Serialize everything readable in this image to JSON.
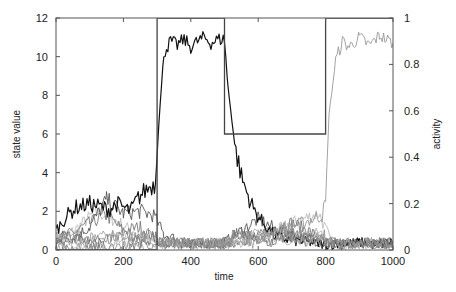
{
  "chart_data": {
    "type": "line",
    "title": "",
    "xlabel": "time",
    "ylabel": "state value",
    "y2label": "activity",
    "xlim": [
      0,
      1000
    ],
    "ylim": [
      0,
      12
    ],
    "y2lim": [
      0,
      1
    ],
    "x_ticks": [
      "0",
      "200",
      "400",
      "600",
      "800",
      "1000"
    ],
    "y_ticks": [
      "0",
      "2",
      "4",
      "6",
      "8",
      "10",
      "12"
    ],
    "y2_ticks": [
      "0",
      "0.2",
      "0.4",
      "0.6",
      "0.8",
      "1"
    ],
    "grid": false,
    "legend": null,
    "series": [
      {
        "name": "activity (step, right axis)",
        "axis": "right",
        "color": "#444444",
        "x": [
          0,
          300,
          300,
          500,
          500,
          800,
          800,
          1000
        ],
        "values": [
          0,
          0,
          1,
          1,
          0.5,
          0.5,
          1,
          1
        ]
      },
      {
        "name": "state A (black)",
        "axis": "left",
        "color": "#111111",
        "x": [
          0,
          20,
          40,
          60,
          80,
          100,
          120,
          140,
          160,
          180,
          200,
          220,
          240,
          260,
          280,
          295,
          305,
          320,
          340,
          360,
          380,
          400,
          420,
          440,
          460,
          480,
          500,
          510,
          530,
          550,
          570,
          590,
          610,
          630,
          650,
          700,
          750,
          800,
          850,
          900,
          950,
          1000
        ],
        "values": [
          1.0,
          1.5,
          1.9,
          2.2,
          2.3,
          2.4,
          2.3,
          2.2,
          2.1,
          2.4,
          2.2,
          2.0,
          2.6,
          3.0,
          3.3,
          3.4,
          6.5,
          10.2,
          10.8,
          10.6,
          10.9,
          10.5,
          10.8,
          11.0,
          10.7,
          10.9,
          10.9,
          8.5,
          5.5,
          3.8,
          2.8,
          2.0,
          1.5,
          1.1,
          0.7,
          0.5,
          0.4,
          0.3,
          0.3,
          0.4,
          0.3,
          0.4
        ]
      },
      {
        "name": "state B (light gray)",
        "axis": "left",
        "color": "#999999",
        "x": [
          0,
          100,
          200,
          300,
          400,
          500,
          600,
          700,
          790,
          800,
          810,
          830,
          850,
          870,
          900,
          930,
          960,
          1000
        ],
        "values": [
          0.5,
          0.6,
          0.8,
          0.3,
          0.3,
          0.4,
          0.8,
          1.2,
          1.8,
          2.5,
          7.0,
          9.8,
          10.8,
          10.5,
          11.0,
          10.6,
          11.1,
          10.7
        ]
      },
      {
        "name": "state C (dark gray)",
        "axis": "left",
        "color": "#555555",
        "x": [
          0,
          50,
          100,
          150,
          200,
          250,
          290,
          320,
          400,
          500,
          550,
          600,
          650,
          700,
          750,
          800,
          900,
          1000
        ],
        "values": [
          0.8,
          0.6,
          1.2,
          2.6,
          1.9,
          2.0,
          1.8,
          0.8,
          0.3,
          0.4,
          1.0,
          1.6,
          1.1,
          0.8,
          0.6,
          0.3,
          0.3,
          0.4
        ]
      },
      {
        "name": "state D (mid gray)",
        "axis": "left",
        "color": "#777777",
        "x": [
          0,
          50,
          100,
          150,
          200,
          250,
          300,
          400,
          500,
          600,
          650,
          700,
          750,
          800,
          900,
          1000
        ],
        "values": [
          0.6,
          0.9,
          1.4,
          1.8,
          1.0,
          1.2,
          0.5,
          0.3,
          0.3,
          0.7,
          1.2,
          1.4,
          1.0,
          0.4,
          0.3,
          0.3
        ]
      },
      {
        "name": "state E (pale gray)",
        "axis": "left",
        "color": "#bbbbbb",
        "x": [
          0,
          60,
          120,
          180,
          240,
          300,
          400,
          500,
          600,
          700,
          780,
          820,
          900,
          1000
        ],
        "values": [
          0.4,
          1.1,
          2.0,
          1.5,
          0.8,
          0.4,
          0.3,
          0.3,
          0.5,
          1.4,
          1.9,
          0.3,
          0.3,
          0.3
        ]
      }
    ]
  }
}
